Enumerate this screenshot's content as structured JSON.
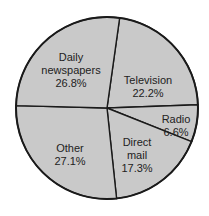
{
  "chart_data": {
    "type": "pie",
    "title": "",
    "start_angle_deg_clockwise_from_top": 8,
    "direction": "clockwise",
    "categories": [
      "Television",
      "Radio",
      "Direct mail",
      "Other",
      "Daily newspapers"
    ],
    "values": [
      22.2,
      6.6,
      17.3,
      27.1,
      26.8
    ],
    "labels": [
      {
        "name": "Television",
        "value": "22.2%"
      },
      {
        "name": "Radio",
        "value": "6.6%"
      },
      {
        "name": "Direct mail",
        "value": "17.3%"
      },
      {
        "name": "Other",
        "value": "27.1%"
      },
      {
        "name": "Daily newspapers",
        "value": "26.8%"
      }
    ],
    "legend": "none (labels inside slices)",
    "colors": {
      "fill": "#c9c9c9",
      "stroke": "#1a1a1a",
      "text": "#222222"
    }
  },
  "labels": {
    "television": {
      "line1": "Television",
      "line2": "22.2%"
    },
    "radio": {
      "line1": "Radio",
      "line2": "6.6%"
    },
    "direct_mail": {
      "line1": "Direct",
      "line2": "mail",
      "line3": "17.3%"
    },
    "other": {
      "line1": "Other",
      "line2": "27.1%"
    },
    "newspapers": {
      "line1": "Daily",
      "line2": "newspapers",
      "line3": "26.8%"
    }
  }
}
